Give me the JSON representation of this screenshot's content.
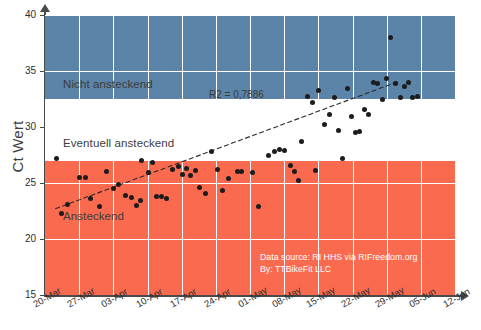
{
  "chart_data": {
    "type": "scatter",
    "title": "",
    "xlabel": "",
    "ylabel": "Ct Wert",
    "ylim": [
      15,
      40
    ],
    "yticks": [
      15,
      20,
      25,
      30,
      35,
      40
    ],
    "xticks": [
      "20-Mar",
      "27-Mar",
      "03-Apr",
      "10-Apr",
      "17-Apr",
      "24-Apr",
      "01-May",
      "08-May",
      "15-May",
      "22-May",
      "29-May",
      "05-Jun",
      "12-Jun"
    ],
    "xlim": [
      "20-Mar",
      "12-Jun"
    ],
    "grid": true,
    "legend": "none",
    "annotations": [
      {
        "name": "r2",
        "text": "R2 = 0,7886",
        "x_frac": 0.4,
        "y_value": 32.9
      }
    ],
    "source_note": {
      "line1": "Data source: RI HHS via RIFreedom.org",
      "line2": "By: TTBikeFit LLC"
    },
    "bands": [
      {
        "label": "Nicht ansteckend",
        "from": 32.5,
        "to": 40,
        "color": "#5b84a8",
        "label_y": 33.7
      },
      {
        "label": "Eventuell ansteckend",
        "from": 27.0,
        "to": 32.5,
        "color": "#ffffff",
        "label_y": 28.4
      },
      {
        "label": "Ansteckend",
        "from": 15,
        "to": 27.0,
        "color": "#fa6a4e",
        "label_y": 21.9
      }
    ],
    "trendline": {
      "x_frac_start": 0.025,
      "y_start": 22.7,
      "x_frac_end": 0.865,
      "y_end": 34.1,
      "style": "dashed",
      "color": "#2a2a2a"
    },
    "series": [
      {
        "name": "Ct Wert",
        "marker": "circle",
        "color": "#1c1c1c",
        "points": [
          {
            "x_frac": 0.028,
            "y": 27.2
          },
          {
            "x_frac": 0.04,
            "y": 22.3
          },
          {
            "x_frac": 0.055,
            "y": 23.1
          },
          {
            "x_frac": 0.085,
            "y": 25.5
          },
          {
            "x_frac": 0.098,
            "y": 25.5
          },
          {
            "x_frac": 0.112,
            "y": 23.6
          },
          {
            "x_frac": 0.133,
            "y": 22.9
          },
          {
            "x_frac": 0.15,
            "y": 26.0
          },
          {
            "x_frac": 0.168,
            "y": 24.5
          },
          {
            "x_frac": 0.18,
            "y": 24.9
          },
          {
            "x_frac": 0.196,
            "y": 23.9
          },
          {
            "x_frac": 0.212,
            "y": 23.7
          },
          {
            "x_frac": 0.222,
            "y": 23.0
          },
          {
            "x_frac": 0.232,
            "y": 23.4
          },
          {
            "x_frac": 0.252,
            "y": 25.9
          },
          {
            "x_frac": 0.272,
            "y": 23.8
          },
          {
            "x_frac": 0.285,
            "y": 23.8
          },
          {
            "x_frac": 0.296,
            "y": 23.6
          },
          {
            "x_frac": 0.312,
            "y": 26.2
          },
          {
            "x_frac": 0.325,
            "y": 26.5
          },
          {
            "x_frac": 0.336,
            "y": 25.8
          },
          {
            "x_frac": 0.346,
            "y": 26.3
          },
          {
            "x_frac": 0.356,
            "y": 25.7
          },
          {
            "x_frac": 0.368,
            "y": 26.1
          },
          {
            "x_frac": 0.378,
            "y": 24.6
          },
          {
            "x_frac": 0.392,
            "y": 24.1
          },
          {
            "x_frac": 0.405,
            "y": 27.8
          },
          {
            "x_frac": 0.42,
            "y": 26.2
          },
          {
            "x_frac": 0.432,
            "y": 24.3
          },
          {
            "x_frac": 0.448,
            "y": 25.4
          },
          {
            "x_frac": 0.47,
            "y": 26.0
          },
          {
            "x_frac": 0.48,
            "y": 26.0
          },
          {
            "x_frac": 0.505,
            "y": 25.9
          },
          {
            "x_frac": 0.52,
            "y": 22.9
          },
          {
            "x_frac": 0.545,
            "y": 27.5
          },
          {
            "x_frac": 0.56,
            "y": 27.8
          },
          {
            "x_frac": 0.572,
            "y": 28.0
          },
          {
            "x_frac": 0.585,
            "y": 27.9
          },
          {
            "x_frac": 0.598,
            "y": 26.6
          },
          {
            "x_frac": 0.608,
            "y": 26.0
          },
          {
            "x_frac": 0.625,
            "y": 28.7
          },
          {
            "x_frac": 0.64,
            "y": 32.7
          },
          {
            "x_frac": 0.652,
            "y": 32.2
          },
          {
            "x_frac": 0.668,
            "y": 33.3
          },
          {
            "x_frac": 0.682,
            "y": 30.2
          },
          {
            "x_frac": 0.694,
            "y": 31.1
          },
          {
            "x_frac": 0.706,
            "y": 32.6
          },
          {
            "x_frac": 0.716,
            "y": 29.7
          },
          {
            "x_frac": 0.726,
            "y": 27.2
          },
          {
            "x_frac": 0.738,
            "y": 33.4
          },
          {
            "x_frac": 0.748,
            "y": 30.9
          },
          {
            "x_frac": 0.758,
            "y": 29.5
          },
          {
            "x_frac": 0.768,
            "y": 29.6
          },
          {
            "x_frac": 0.78,
            "y": 31.6
          },
          {
            "x_frac": 0.79,
            "y": 31.1
          },
          {
            "x_frac": 0.802,
            "y": 34.0
          },
          {
            "x_frac": 0.812,
            "y": 33.9
          },
          {
            "x_frac": 0.822,
            "y": 32.5
          },
          {
            "x_frac": 0.832,
            "y": 34.3
          },
          {
            "x_frac": 0.842,
            "y": 38.0
          },
          {
            "x_frac": 0.856,
            "y": 33.9
          },
          {
            "x_frac": 0.866,
            "y": 32.6
          },
          {
            "x_frac": 0.876,
            "y": 33.6
          },
          {
            "x_frac": 0.886,
            "y": 34.0
          },
          {
            "x_frac": 0.896,
            "y": 32.6
          },
          {
            "x_frac": 0.908,
            "y": 32.7
          },
          {
            "x_frac": 0.236,
            "y": 27.0
          },
          {
            "x_frac": 0.262,
            "y": 26.8
          },
          {
            "x_frac": 0.66,
            "y": 26.1
          },
          {
            "x_frac": 0.618,
            "y": 25.2
          }
        ]
      }
    ]
  }
}
